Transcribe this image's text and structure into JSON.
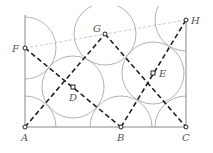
{
  "diagram": {
    "type": "geometry-construction",
    "points": {
      "A": {
        "label": "A",
        "x": 25,
        "y": 127
      },
      "B": {
        "label": "B",
        "x": 121,
        "y": 127
      },
      "C": {
        "label": "C",
        "x": 186,
        "y": 127
      },
      "D": {
        "label": "D",
        "x": 73,
        "y": 87
      },
      "E": {
        "label": "E",
        "x": 153,
        "y": 73
      },
      "F": {
        "label": "F",
        "x": 25,
        "y": 48
      },
      "G": {
        "label": "G",
        "x": 105,
        "y": 34
      },
      "H": {
        "label": "H",
        "x": 186,
        "y": 20
      }
    },
    "dashed_bold_segments": [
      [
        "F",
        "B"
      ],
      [
        "A",
        "G"
      ],
      [
        "G",
        "C"
      ],
      [
        "B",
        "H"
      ]
    ],
    "dashed_thin_segments": [
      [
        "F",
        "H"
      ]
    ],
    "solid_segments": [
      [
        "A",
        "C"
      ]
    ],
    "colors": {
      "dashed": "#222222",
      "thin": "#999999",
      "circle": "#9a9a9a"
    }
  }
}
